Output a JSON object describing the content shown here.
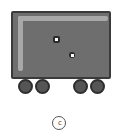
{
  "diagram": {
    "label": "c",
    "colors": {
      "body": "#6e6e6e",
      "outline": "#3a3a3a",
      "highlight": "#a8a8a8",
      "wheel": "#555555",
      "rivet_center": "#ffffff"
    },
    "wheels": [
      {
        "id": "wheel-1",
        "x": 18
      },
      {
        "id": "wheel-2",
        "x": 35
      },
      {
        "id": "wheel-3",
        "x": 73
      },
      {
        "id": "wheel-4",
        "x": 90
      }
    ]
  }
}
